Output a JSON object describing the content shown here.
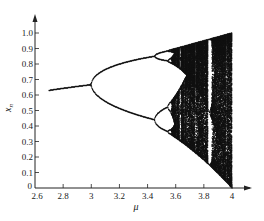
{
  "chart_data": {
    "type": "scatter",
    "title": "",
    "subtitle": "Bifurcation diagram of the logistic map x_{n+1} = μ x_n (1 − x_n)",
    "xlabel": "μ",
    "ylabel": "x_n",
    "xlim": [
      2.6,
      4.05
    ],
    "ylim": [
      0,
      1.05
    ],
    "grid": false,
    "legend": null,
    "x_ticks": [
      2.6,
      2.8,
      3,
      3.2,
      3.4,
      3.6,
      3.8,
      4
    ],
    "x_tick_labels": [
      "2.6",
      "2.8",
      "3",
      "3.2",
      "3.4",
      "3.6",
      "3.8",
      "4"
    ],
    "y_ticks": [
      0,
      0.1,
      0.2,
      0.3,
      0.4,
      0.5,
      0.6,
      0.7,
      0.8,
      0.9,
      1.0
    ],
    "y_tick_labels": [
      "0",
      "0.1",
      "0.2",
      "0.3",
      "0.4",
      "0.5",
      "0.6",
      "0.7",
      "0.8",
      "0.9",
      "1.0"
    ],
    "mu_range_plotted": [
      2.7,
      4.0
    ],
    "annotations": [
      {
        "mu": 2.7,
        "x": 0.63,
        "note": "single stable fixed point"
      },
      {
        "mu": 3.0,
        "x": 0.667,
        "note": "first period-doubling bifurcation"
      },
      {
        "mu": 3.449,
        "note": "period-4 bifurcation"
      },
      {
        "mu": 3.57,
        "note": "onset of chaos"
      },
      {
        "mu": 4.0,
        "x_range": [
          0,
          1
        ],
        "note": "fully chaotic band"
      }
    ],
    "series": [
      {
        "name": "fixed point",
        "mu": [
          2.7,
          2.8,
          2.9,
          3.0
        ],
        "x": [
          0.63,
          0.643,
          0.655,
          0.667
        ]
      },
      {
        "name": "period-2 upper",
        "mu": [
          3.0,
          3.1,
          3.2,
          3.3,
          3.4,
          3.45
        ],
        "x": [
          0.667,
          0.765,
          0.799,
          0.824,
          0.842,
          0.849
        ]
      },
      {
        "name": "period-2 lower",
        "mu": [
          3.0,
          3.1,
          3.2,
          3.3,
          3.4,
          3.45
        ],
        "x": [
          0.667,
          0.558,
          0.513,
          0.479,
          0.452,
          0.44
        ]
      }
    ]
  },
  "axes": {
    "x_label": "μ",
    "y_label": "x",
    "y_label_sub": "n"
  },
  "colors": {
    "ink": "#111111",
    "background": "#ffffff"
  }
}
